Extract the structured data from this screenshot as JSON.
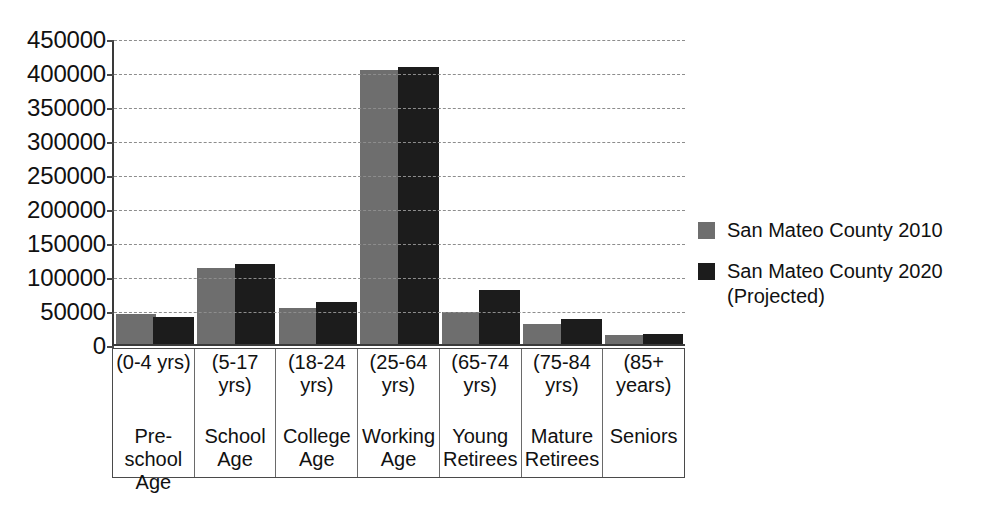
{
  "chart_data": {
    "type": "bar",
    "title": "",
    "xlabel": "",
    "ylabel": "",
    "ylim": [
      0,
      450000
    ],
    "ytick_step": 50000,
    "yticks": [
      "450000",
      "400000",
      "350000",
      "300000",
      "250000",
      "200000",
      "150000",
      "100000",
      "50000",
      "0"
    ],
    "grid": true,
    "legend_position": "right",
    "categories": [
      "Pre-\nschool\nAge",
      "School\nAge",
      "College\nAge",
      "Working\nAge",
      "Young\nRetirees",
      "Mature\nRetirees",
      "Seniors"
    ],
    "category_ranges": [
      "(0-4 yrs)",
      "(5-17\nyrs)",
      "(18-24\nyrs)",
      "(25-64\nyrs)",
      "(65-74\nyrs)",
      "(75-84\nyrs)",
      "(85+\nyears)"
    ],
    "series": [
      {
        "name": "San Mateo County 2010",
        "color": "#6e6e6e",
        "values": [
          44000,
          113000,
          53000,
          406000,
          48000,
          29000,
          14000
        ]
      },
      {
        "name": "San Mateo County 2020\n(Projected)",
        "color": "#1c1c1c",
        "values": [
          40000,
          118000,
          62000,
          410000,
          80000,
          37000,
          15000
        ]
      }
    ]
  },
  "legend": {
    "entries": [
      {
        "label": "San Mateo County 2010",
        "color": "#6e6e6e"
      },
      {
        "label": "San Mateo County 2020\n(Projected)",
        "color": "#1c1c1c"
      }
    ]
  }
}
